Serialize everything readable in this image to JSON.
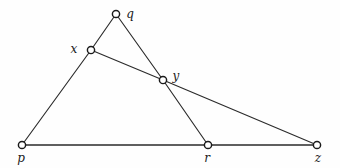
{
  "diagram": {
    "type": "undirected-graph",
    "width": 340,
    "height": 168,
    "background_color": "#fefefe",
    "stroke_color": "#2b2b2b",
    "vertex_fill_color": "#ffffff",
    "vertex_stroke_color": "#1a1a1a",
    "vertex_radius": 3.6,
    "vertices": [
      {
        "id": "q",
        "label": "q",
        "cx": 116,
        "cy": 14,
        "label_x": 130,
        "label_y": 14
      },
      {
        "id": "x",
        "label": "x",
        "cx": 91,
        "cy": 50,
        "label_x": 74,
        "label_y": 49
      },
      {
        "id": "y",
        "label": "y",
        "cx": 163,
        "cy": 80,
        "label_x": 176,
        "label_y": 76
      },
      {
        "id": "p",
        "label": "p",
        "cx": 22,
        "cy": 145,
        "label_x": 21,
        "label_y": 158
      },
      {
        "id": "r",
        "label": "r",
        "cx": 208,
        "cy": 145,
        "label_x": 207,
        "label_y": 158
      },
      {
        "id": "z",
        "label": "z",
        "cx": 317,
        "cy": 145,
        "label_x": 318,
        "label_y": 158
      }
    ],
    "edges": [
      {
        "from": "q",
        "to": "x",
        "x1": 116,
        "y1": 14,
        "x2": 91,
        "y2": 50,
        "baseline": false
      },
      {
        "from": "q",
        "to": "y",
        "x1": 116,
        "y1": 14,
        "x2": 163,
        "y2": 80,
        "baseline": false
      },
      {
        "from": "x",
        "to": "y",
        "x1": 91,
        "y1": 50,
        "x2": 163,
        "y2": 80,
        "baseline": false
      },
      {
        "from": "x",
        "to": "p",
        "x1": 91,
        "y1": 50,
        "x2": 22,
        "y2": 145,
        "baseline": false
      },
      {
        "from": "y",
        "to": "r",
        "x1": 163,
        "y1": 80,
        "x2": 208,
        "y2": 145,
        "baseline": false
      },
      {
        "from": "y",
        "to": "z",
        "x1": 163,
        "y1": 80,
        "x2": 317,
        "y2": 145,
        "baseline": false
      },
      {
        "from": "p",
        "to": "r",
        "x1": 22,
        "y1": 145,
        "x2": 208,
        "y2": 145,
        "baseline": true
      },
      {
        "from": "r",
        "to": "z",
        "x1": 208,
        "y1": 145,
        "x2": 317,
        "y2": 145,
        "baseline": true
      }
    ]
  }
}
